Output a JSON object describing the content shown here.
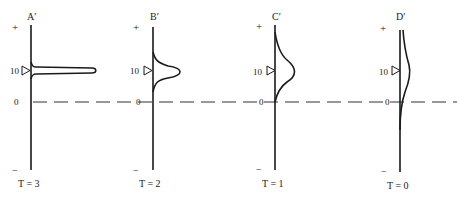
{
  "figure": {
    "panels": [
      {
        "id": "A",
        "title": "A′",
        "time_label": "T = 3",
        "axis_x": 31,
        "curve": "sharp"
      },
      {
        "id": "B",
        "title": "B′",
        "time_label": "T = 2",
        "axis_x": 153,
        "curve": "medium"
      },
      {
        "id": "C",
        "title": "C′",
        "time_label": "T = 1",
        "axis_x": 275,
        "curve": "broad"
      },
      {
        "id": "D",
        "title": "D′",
        "time_label": "T = 0",
        "axis_x": 400,
        "curve": "flat"
      }
    ],
    "axis_labels": {
      "plus": "+",
      "ten": "10",
      "zero": "0",
      "minus": "−"
    },
    "marker": "triangle-pointer-at-10",
    "baseline": "dashed-zero-line"
  },
  "colors": {
    "ink": "#1a1a1a",
    "background": "#ffffff"
  }
}
